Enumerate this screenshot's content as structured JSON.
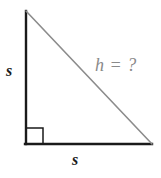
{
  "figure": {
    "kind": "right-triangle-diagram",
    "background_color": "#ffffff",
    "labels": {
      "vertical_leg": "s",
      "horizontal_leg": "s",
      "hypotenuse": "h = ?"
    },
    "colors": {
      "leg_stroke": "#1a1a1a",
      "hypotenuse_stroke": "#8c8c8c",
      "right_angle_stroke": "#1a1a1a",
      "label_text": "#1c1c1c",
      "hypotenuse_label_text": "#8a8a8a"
    },
    "geometry": {
      "apex_x": 26,
      "apex_y": 11,
      "right_angle_x": 26,
      "right_angle_y": 144,
      "far_x": 152,
      "far_y": 144,
      "right_angle_marker_size": 16,
      "leg_stroke_width": 2.4,
      "hypotenuse_stroke_width": 1.6
    }
  }
}
